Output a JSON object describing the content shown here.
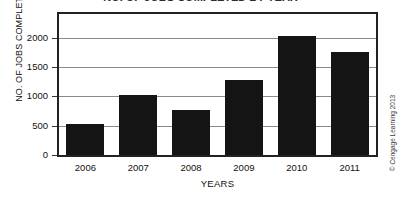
{
  "figure": {
    "title_cropped": "NO. OF JOBS COMPLETED BY YEAR",
    "copyright": "© Cengage Learning 2013"
  },
  "chart_data": {
    "type": "bar",
    "title": "",
    "xlabel": "YEARS",
    "ylabel": "NO. OF JOBS COMPLETED",
    "categories": [
      "2006",
      "2007",
      "2008",
      "2009",
      "2010",
      "2011"
    ],
    "values": [
      525,
      1030,
      760,
      1275,
      2020,
      1760
    ],
    "series": [
      {
        "name": "No. of jobs completed",
        "values": [
          525,
          1030,
          760,
          1275,
          2020,
          1760
        ]
      }
    ],
    "ylim": [
      0,
      2400
    ],
    "yticks": [
      0,
      500,
      1000,
      1500,
      2000
    ],
    "ytick_labels": [
      "0",
      "500",
      "1000",
      "1500",
      "2000"
    ],
    "grid": true,
    "grid_axis": "y",
    "legend": false,
    "bar_color": "#141414",
    "frame_color": "#222222",
    "grid_color": "#8a8a8a",
    "background": "#ffffff"
  }
}
